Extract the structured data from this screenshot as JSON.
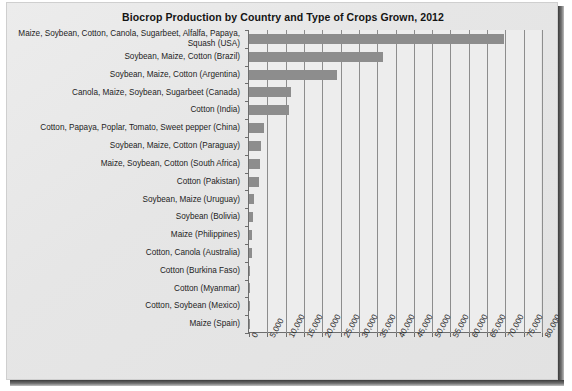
{
  "chart_data": {
    "type": "bar",
    "orientation": "horizontal",
    "title": "Biocrop Production by Country and Type of Crops Grown, 2012",
    "xlabel": "",
    "ylabel": "",
    "xlim": [
      0,
      80000
    ],
    "xtick_step": 5000,
    "grid": true,
    "legend": "none",
    "bar_color": "#8d8d8d",
    "plot_background": "#ededed",
    "page_background": "#e6e6e6",
    "axis_color": "#6d6d6d",
    "xticklabels": [
      "0",
      "5,000",
      "10,000",
      "15,000",
      "20,000",
      "25,000",
      "30,000",
      "35,000",
      "40,000",
      "45,000",
      "50,000",
      "55,000",
      "60,000",
      "65,000",
      "70,000",
      "75,000",
      "80,000"
    ],
    "categories": [
      "Maize, Soybean, Cotton, Canola, Sugarbeet, Alfalfa, Papaya, Squash (USA)",
      "Soybean, Maize, Cotton (Brazil)",
      "Soybean, Maize, Cotton (Argentina)",
      "Canola, Maize, Soybean, Sugarbeet (Canada)",
      "Cotton (India)",
      "Cotton, Papaya, Poplar, Tomato, Sweet pepper (China)",
      "Soybean, Maize, Cotton (Paraguay)",
      "Maize, Soybean, Cotton (South Africa)",
      "Cotton (Pakistan)",
      "Soybean, Maize (Uruguay)",
      "Soybean (Bolivia)",
      "Maize (Philippines)",
      "Cotton, Canola (Australia)",
      "Cotton (Burkina Faso)",
      "Cotton (Myanmar)",
      "Cotton, Soybean (Mexico)",
      "Maize (Spain)"
    ],
    "values": [
      69500,
      36600,
      23900,
      11600,
      10800,
      4000,
      3400,
      2900,
      2800,
      1400,
      1000,
      800,
      700,
      300,
      300,
      200,
      100
    ]
  }
}
